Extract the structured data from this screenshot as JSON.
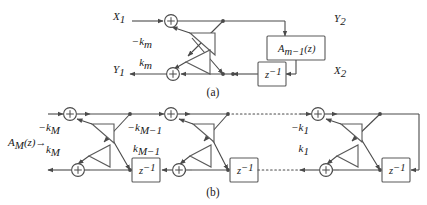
{
  "figure": {
    "background_color": "#ffffff",
    "line_color": "#4a4a4a",
    "text_color": "#1a1a1a",
    "panels": [
      {
        "id": "panel-a",
        "caption": "(a)",
        "signals": {
          "input_top": "X",
          "input_top_sub": "1",
          "output_bottom": "Y",
          "output_bottom_sub": "1",
          "internal_top": "Y",
          "internal_top_sub": "2",
          "internal_bottom": "X",
          "internal_bottom_sub": "2"
        },
        "gains": [
          {
            "name": "gain-upper",
            "label": "−k",
            "sub": "m"
          },
          {
            "name": "gain-lower",
            "label": "k",
            "sub": "m"
          }
        ],
        "blocks": [
          {
            "name": "allpass-block",
            "label": "A",
            "sub": "m−1",
            "suffix": "(z)"
          },
          {
            "name": "delay-block",
            "label": "z",
            "sup": "−1"
          }
        ],
        "adders": [
          {
            "name": "adder-top",
            "symbol": "+"
          },
          {
            "name": "adder-bottom",
            "symbol": "+"
          }
        ]
      },
      {
        "id": "panel-b",
        "caption": "(b)",
        "signals": {
          "input_label": "A",
          "input_label_sub": "M",
          "input_label_suffix": "(z)",
          "input_arrow": "→"
        },
        "stages": [
          {
            "name": "stage-M",
            "gain_upper": "−k",
            "gain_upper_sub": "M",
            "gain_lower": "k",
            "gain_lower_sub": "M"
          },
          {
            "name": "stage-M-minus-1",
            "gain_upper": "−k",
            "gain_upper_sub": "M−1",
            "gain_lower": "k",
            "gain_lower_sub": "M−1"
          },
          {
            "name": "stage-1",
            "gain_upper": "−k",
            "gain_upper_sub": "1",
            "gain_lower": "k",
            "gain_lower_sub": "1"
          }
        ],
        "delay_blocks": [
          {
            "name": "delay-block-1",
            "label": "z",
            "sup": "−1"
          },
          {
            "name": "delay-block-2",
            "label": "z",
            "sup": "−1"
          },
          {
            "name": "delay-block-3",
            "label": "z",
            "sup": "−1"
          }
        ],
        "adders": [
          {
            "name": "adder-top-1",
            "symbol": "+"
          },
          {
            "name": "adder-bottom-1",
            "symbol": "+"
          },
          {
            "name": "adder-top-2",
            "symbol": "+"
          },
          {
            "name": "adder-bottom-2",
            "symbol": "+"
          },
          {
            "name": "adder-top-3",
            "symbol": "+"
          },
          {
            "name": "adder-bottom-3",
            "symbol": "+"
          }
        ],
        "continuation": "dotted-ellipsis"
      }
    ]
  }
}
